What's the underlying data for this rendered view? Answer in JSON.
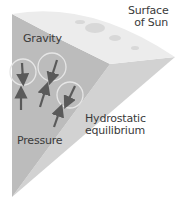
{
  "diagram": {
    "labels": {
      "surface": [
        "Surface",
        "of Sun"
      ],
      "gravity": "Gravity",
      "pressure": "Pressure",
      "equilibrium": [
        "Hydrostatic",
        "equilibrium"
      ]
    },
    "colors": {
      "background": "#ffffff",
      "front_face": "#bcbcbc",
      "side_face": "#d2d2d2",
      "surface_face": "#ececec",
      "arrow": "#5a5a5a",
      "circle": "#e6e6e6",
      "text": "#3a3a3a"
    },
    "arrow_pairs": [
      {
        "gravity": "down",
        "pressure": "up"
      },
      {
        "gravity": "down",
        "pressure": "up"
      },
      {
        "gravity": "down",
        "pressure": "up"
      }
    ]
  }
}
